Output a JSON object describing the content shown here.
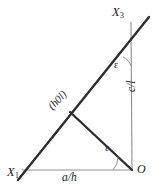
{
  "figure": {
    "type": "crystallographic-plane-trace-diagram",
    "background_color": "#ffffff",
    "stroke_color_thick": "#2b2b2b",
    "stroke_color_thin": "#8a8a8a",
    "text_color": "#1a1a1a"
  },
  "labels": {
    "axis_x3": "X",
    "axis_x3_sub": "3",
    "axis_x1": "X",
    "axis_x1_sub": "1",
    "origin": "O",
    "intercept_a": "a/h",
    "intercept_c": "c/l",
    "plane_index": "(h0l)",
    "angle_top": "ε",
    "angle_bottom": "ε"
  },
  "geometry": {
    "origin_point": [
      132,
      170
    ],
    "x3_axis_top": [
      131,
      22
    ],
    "x1_axis_left": [
      22,
      170
    ],
    "trace_line_start": [
      18,
      180
    ],
    "trace_line_end": [
      149,
      17
    ],
    "plane_point": [
      70,
      112
    ],
    "angle_top_deg": 38,
    "angle_bottom_deg": 44
  }
}
